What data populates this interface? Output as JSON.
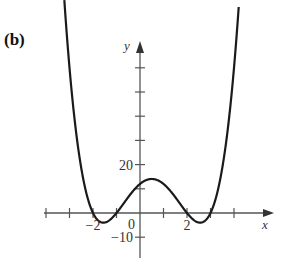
{
  "panel_label": "(b)",
  "chart_data": {
    "type": "line",
    "title": "",
    "xlabel": "x",
    "ylabel": "y",
    "function": "f(x) = (x+2)(x+1)(x-2)(x-3)",
    "roots": [
      -2,
      -1,
      2,
      3
    ],
    "y_intercept": 12,
    "local_max": {
      "x": 0.5,
      "y": 14.06
    },
    "x_ticks": [
      -4,
      -3,
      -2,
      -1,
      1,
      2,
      3,
      4
    ],
    "x_tick_labels": [
      {
        "value": -2,
        "label": "−2"
      },
      {
        "value": 2,
        "label": "2"
      }
    ],
    "y_ticks": [
      -10,
      10,
      20,
      30,
      40,
      50,
      60
    ],
    "y_tick_labels": [
      {
        "value": 20,
        "label": "20"
      },
      {
        "value": -10,
        "label": "−10"
      }
    ],
    "origin_label": "0",
    "xlim": [
      -4,
      5.5
    ],
    "ylim": [
      -18,
      72
    ],
    "x": [
      -3.2,
      -3.0,
      -2.5,
      -2.0,
      -1.5,
      -1.0,
      -0.5,
      0.0,
      0.5,
      1.0,
      1.5,
      2.0,
      2.5,
      3.0,
      3.5,
      4.0,
      4.2
    ],
    "y": [
      52.1,
      30.0,
      4.8,
      0.0,
      -3.9,
      0.0,
      8.4,
      12.0,
      14.1,
      12.0,
      6.9,
      0.0,
      -4.1,
      0.0,
      11.8,
      36.0,
      48.3
    ],
    "grid": false,
    "legend": null
  }
}
